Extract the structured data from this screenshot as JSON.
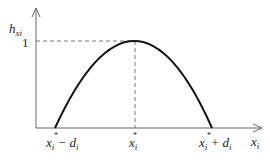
{
  "diagram": {
    "type": "membership-function-parabola",
    "y_axis_label": {
      "main": "h",
      "sub": "xi"
    },
    "y_tick": "1",
    "x_axis_label": {
      "main": "x",
      "sub": "i"
    },
    "x_ticks": [
      {
        "main": "x",
        "sub": "i",
        "suffix": " − d",
        "suffix_sub": "i"
      },
      {
        "main": "x",
        "sub": "i",
        "suffix": "",
        "suffix_sub": ""
      },
      {
        "main": "x",
        "sub": "i",
        "suffix": " + d",
        "suffix_sub": "i"
      }
    ],
    "colors": {
      "curve": "#111111",
      "axis": "#666666",
      "dash": "#777777"
    }
  }
}
